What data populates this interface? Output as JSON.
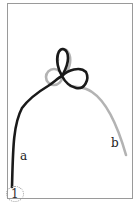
{
  "figure": {
    "type": "knot-tying diagram",
    "step_number": "1",
    "labels": {
      "end_a": "a",
      "end_b": "b"
    },
    "colors": {
      "strand_a": "#1a1a1a",
      "strand_b": "#b3b3b3",
      "frame": "#9a9a9a"
    }
  }
}
